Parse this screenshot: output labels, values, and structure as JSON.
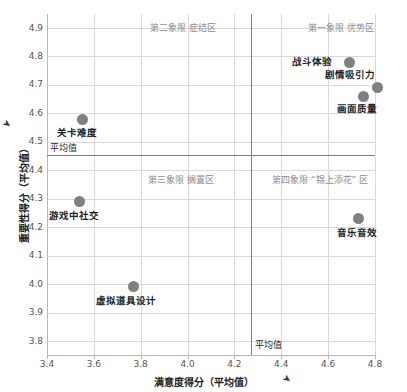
{
  "chart_data": {
    "type": "scatter",
    "title": "",
    "xlabel": "满意度得分（平均值）",
    "ylabel": "重要性得分（平均值）",
    "xlim": [
      3.4,
      4.9
    ],
    "ylim": [
      3.75,
      4.95
    ],
    "xticks": [
      "3.4",
      "3.6",
      "3.8",
      "4.0",
      "4.2",
      "4.4",
      "4.6",
      "4.8"
    ],
    "xtick_values": [
      3.4,
      3.6,
      3.8,
      4.0,
      4.2,
      4.4,
      4.6,
      4.8
    ],
    "yticks": [
      "4.9",
      "4.8",
      "4.7",
      "4.6",
      "4.5",
      "4.4",
      "4.3",
      "4.2",
      "4.1",
      "4.0",
      "3.9",
      "3.8"
    ],
    "ytick_values": [
      4.9,
      4.8,
      4.7,
      4.6,
      4.5,
      4.4,
      4.3,
      4.2,
      4.1,
      4.0,
      3.9,
      3.8
    ],
    "grid": true,
    "legend": "none",
    "point_color": "#808080",
    "mean_line_color": "#7d7d7d",
    "grid_color": "#d9d9d9",
    "mean_x": 4.27,
    "mean_y": 4.455,
    "mean_label_x": "平均值",
    "mean_label_y": "平均值",
    "points": [
      {
        "label": "战斗体验",
        "x": 4.69,
        "y": 4.78
      },
      {
        "label": "剧情吸引力",
        "x": 4.81,
        "y": 4.69
      },
      {
        "label": "画面质量",
        "x": 4.75,
        "y": 4.66
      },
      {
        "label": "关卡难度",
        "x": 3.55,
        "y": 4.58
      },
      {
        "label": "游戏中社交",
        "x": 3.54,
        "y": 4.29
      },
      {
        "label": "音乐音效",
        "x": 4.73,
        "y": 4.23
      },
      {
        "label": "虚拟道具设计",
        "x": 3.77,
        "y": 3.99
      }
    ],
    "quadrants": [
      {
        "name": "第二象限 症结区",
        "position": "top-left"
      },
      {
        "name": "第一象限 优势区",
        "position": "top-right"
      },
      {
        "name": "第三象限 搁置区",
        "position": "bottom-left"
      },
      {
        "name": "第四象限 “锦上添花” 区",
        "position": "bottom-right"
      }
    ],
    "axis_marker_glyph": "➤"
  }
}
